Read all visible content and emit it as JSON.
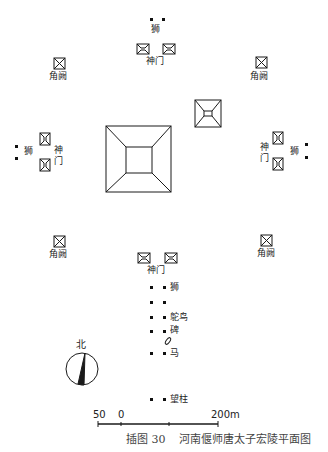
{
  "figure": {
    "caption_number": "插图 30",
    "caption_title": "河南偃师唐太子宏陵平面图"
  },
  "labels": {
    "lion": "狮",
    "spirit_gate": "神门",
    "spirit_gate_v1": "神",
    "spirit_gate_v2": "门",
    "corner_tower": "角阙",
    "ostrich": "鸵鸟",
    "stele": "碑",
    "horse": "马",
    "pillar": "望柱",
    "north": "北"
  },
  "scale_bar": {
    "left_label": "50",
    "zero_label": "0",
    "right_label": "200m"
  },
  "colors": {
    "ink": "#1a1a1a",
    "caption": "#444444",
    "background": "#ffffff"
  }
}
